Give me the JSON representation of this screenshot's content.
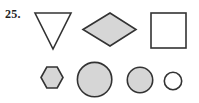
{
  "page": {
    "background_color": "#ffffff",
    "width": 199,
    "height": 103
  },
  "problem": {
    "number_label": "25."
  },
  "style": {
    "stroke_color": "#333333",
    "shaded_fill_color": "#d6d6d6",
    "unshaded_fill_color": "#ffffff",
    "stroke_width": 1.6
  },
  "figure": {
    "rows": [
      {
        "name": "top-row",
        "shapes": [
          {
            "id": "triangle",
            "name": "inverted-triangle",
            "label": "Triangle",
            "fill": "unshaded",
            "fill_color": "#ffffff",
            "stroke_color": "#333333",
            "orientation": "point-down",
            "sides": 3,
            "width": 38,
            "height": 38,
            "points": "1,1 37,1 19,37"
          },
          {
            "id": "diamond",
            "name": "rhombus",
            "label": "Rhombus",
            "fill": "shaded",
            "fill_color": "#d6d6d6",
            "stroke_color": "#333333",
            "orientation": "horizontal-long-axis",
            "sides": 4,
            "width": 55,
            "height": 34,
            "points": "1,17.5 28,1 54,17.5 28,34"
          },
          {
            "id": "square",
            "name": "square",
            "label": "Square",
            "fill": "unshaded",
            "fill_color": "#ffffff",
            "stroke_color": "#333333",
            "sides": 4,
            "width": 36,
            "height": 36,
            "rect": {
              "x": 1,
              "y": 1,
              "w": 35,
              "h": 35
            }
          }
        ]
      },
      {
        "name": "bottom-row",
        "shapes": [
          {
            "id": "hexagon",
            "name": "hexagon",
            "label": "Hexagon",
            "fill": "shaded",
            "fill_color": "#d6d6d6",
            "stroke_color": "#333333",
            "orientation": "pointy-left-right",
            "sides": 6,
            "width": 24,
            "height": 23,
            "points": "1,11.5 6.8,1 17.2,1 23,11.5 17.2,22 6.8,22"
          },
          {
            "id": "circle-large",
            "name": "large-circle",
            "label": "Large circle",
            "fill": "shaded",
            "fill_color": "#d6d6d6",
            "stroke_color": "#333333",
            "diameter": 36,
            "radius": 17.2,
            "cx": 18,
            "cy": 18
          },
          {
            "id": "circle-medium",
            "name": "medium-circle",
            "label": "Medium circle",
            "fill": "shaded",
            "fill_color": "#d6d6d6",
            "stroke_color": "#333333",
            "diameter": 27,
            "radius": 12.7,
            "cx": 13.5,
            "cy": 13.5
          },
          {
            "id": "circle-small",
            "name": "small-circle",
            "label": "Small circle",
            "fill": "unshaded",
            "fill_color": "#ffffff",
            "stroke_color": "#333333",
            "diameter": 19,
            "radius": 8.7,
            "cx": 9.5,
            "cy": 9.5
          }
        ]
      }
    ]
  }
}
